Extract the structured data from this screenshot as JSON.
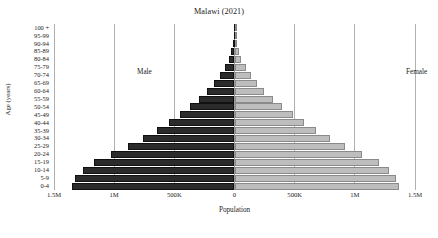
{
  "chart": {
    "title": "Malawi (2021)",
    "xlabel": "Population",
    "ylabel": "Age (years)",
    "annotations": {
      "male": "Male",
      "female": "Female"
    },
    "x_tick_labels": [
      "1.5M",
      "1M",
      "500K",
      "0",
      "500K",
      "1M",
      "1.5M"
    ]
  },
  "chart_data": {
    "type": "bar",
    "subtype": "population-pyramid",
    "title": "Malawi (2021)",
    "xlabel": "Population",
    "ylabel": "Age (years)",
    "grid": true,
    "legend_position": "inside-top",
    "orientation": "horizontal",
    "xlim": [
      -1500000,
      1500000
    ],
    "x_ticks": [
      -1500000,
      -1000000,
      -500000,
      0,
      500000,
      1000000,
      1500000
    ],
    "x_tick_labels": [
      "1.5M",
      "1M",
      "500K",
      "0",
      "500K",
      "1M",
      "1.5M"
    ],
    "categories": [
      "100 +",
      "95-99",
      "90-94",
      "85-89",
      "80-84",
      "75-79",
      "70-74",
      "65-69",
      "60-64",
      "55-59",
      "50-54",
      "45-49",
      "40-44",
      "35-39",
      "30-34",
      "25-29",
      "20-24",
      "15-19",
      "10-14",
      "5-9",
      "0-4"
    ],
    "series": [
      {
        "name": "Male",
        "direction": "left",
        "color": "#2b2b2b",
        "values": [
          2000,
          5000,
          14000,
          27000,
          48000,
          79000,
          118000,
          168000,
          228000,
          296000,
          372000,
          455000,
          545000,
          648000,
          762000,
          889000,
          1025000,
          1168000,
          1262000,
          1322000,
          1352000
        ]
      },
      {
        "name": "Female",
        "direction": "right",
        "color": "#bdbdbd",
        "values": [
          3000,
          7000,
          18000,
          34000,
          58000,
          92000,
          134000,
          186000,
          248000,
          318000,
          396000,
          482000,
          575000,
          679000,
          795000,
          922000,
          1058000,
          1198000,
          1288000,
          1342000,
          1368000
        ]
      }
    ]
  }
}
